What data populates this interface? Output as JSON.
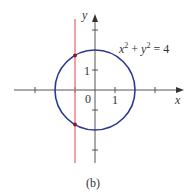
{
  "figure": {
    "caption": "(b)",
    "equation": {
      "base_x": "x",
      "exp1": "2",
      "plus": "+",
      "base_y": "y",
      "exp2": "2",
      "rhs": "= 4"
    },
    "axes": {
      "x_label": "x",
      "y_label": "y",
      "origin_label": "0",
      "x_tick_label": "1",
      "y_tick_label": "1"
    },
    "circle": {
      "equation": "x^2 + y^2 = 4",
      "radius": 2,
      "color": "#2b3a8f"
    },
    "vertical_line": {
      "x": -1,
      "color": "#e8707a"
    },
    "intersection_points": [
      {
        "x": -1,
        "y": 1.732
      },
      {
        "x": -1,
        "y": -1.732
      }
    ],
    "point_color": "#8b1a2a"
  }
}
